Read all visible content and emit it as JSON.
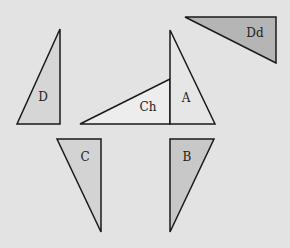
{
  "diagram": {
    "background": "#e3e3e3",
    "stroke": "#1a1a1a",
    "shapes": [
      {
        "id": "D",
        "label": "D",
        "points": "17,124 60,124 60,29",
        "fill": "#d6d6d6",
        "label_pos": [
          43,
          101
        ]
      },
      {
        "id": "Ch",
        "label": "Ch",
        "points": "80,124 170,124 170,79",
        "fill": "#ededed",
        "label_pos": [
          148,
          111
        ]
      },
      {
        "id": "A",
        "label": "A",
        "points": "170,124 215,124 170,30",
        "fill": "#e6e6e6",
        "label_pos": [
          186,
          102
        ]
      },
      {
        "id": "Dd",
        "label": "Dd",
        "points": "185,17 276,17 276,63",
        "fill": "#b5b5b5",
        "label_pos": [
          255,
          37
        ]
      },
      {
        "id": "C",
        "label": "C",
        "points": "57,139 101,139 101,232",
        "fill": "#d3d3d3",
        "label_pos": [
          85,
          161
        ]
      },
      {
        "id": "B",
        "label": "B",
        "points": "170,139 214,139 170,232",
        "fill": "#c8c8c8",
        "label_pos": [
          187,
          161
        ]
      }
    ]
  }
}
